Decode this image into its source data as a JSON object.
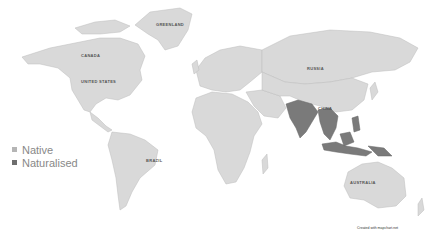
{
  "map": {
    "type": "world choropleth",
    "labels": [
      "GREENLAND",
      "CANADA",
      "UNITED STATES",
      "RUSSIA",
      "CHINA",
      "BRAZIL",
      "AUSTRALIA"
    ],
    "highlighted_regions": [
      "India",
      "Pakistan",
      "Bangladesh",
      "Nepal",
      "Myanmar",
      "Thailand",
      "Laos",
      "Cambodia",
      "Vietnam",
      "Malaysia",
      "Indonesia",
      "Philippines",
      "Papua New Guinea"
    ]
  },
  "legend": {
    "items": [
      {
        "label": "Native",
        "color": "#b5b5b5"
      },
      {
        "label": "Naturalised",
        "color": "#6e6e6e"
      }
    ]
  },
  "credit": "Created with mapchart.net",
  "colors": {
    "land": "#d9d9d9",
    "naturalised": "#7a7a7a",
    "background": "#ffffff"
  }
}
